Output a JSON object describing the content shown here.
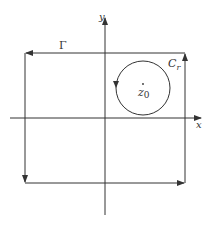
{
  "diagram": {
    "type": "contour-integration",
    "colors": {
      "stroke": "#333333",
      "background": "#ffffff"
    },
    "axes": {
      "x_label": "x",
      "y_label": "y"
    },
    "contour_outer": {
      "label": "Γ",
      "shape": "rectangle",
      "orientation": "counterclockwise"
    },
    "contour_inner": {
      "label": "C",
      "label_subscript": "r",
      "shape": "circle",
      "orientation": "counterclockwise"
    },
    "point": {
      "label": "z",
      "label_subscript": "0"
    }
  }
}
